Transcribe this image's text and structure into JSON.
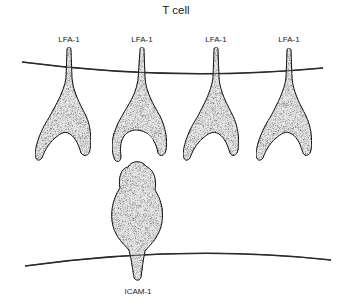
{
  "diagram": {
    "title": "T cell",
    "top_membrane_label": "T cell",
    "receptors": [
      {
        "label": "LFA-1",
        "x": 69,
        "bound": false
      },
      {
        "label": "LFA-1",
        "x": 142,
        "bound": true
      },
      {
        "label": "LFA-1",
        "x": 216,
        "bound": false
      },
      {
        "label": "LFA-1",
        "x": 289,
        "bound": false
      }
    ],
    "ligand": {
      "label": "ICAM-1",
      "x": 138
    },
    "colors": {
      "ink": "#1a1a1a",
      "stipple_fill": "#e6e6e6",
      "membrane": "#2a2a2a",
      "background": "#ffffff"
    }
  }
}
